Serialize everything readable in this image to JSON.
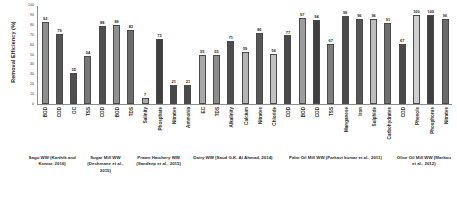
{
  "chart_data": {
    "type": "bar",
    "title": "",
    "xlabel": "",
    "ylabel": "Removal Efficiency (%)",
    "ylim": [
      0,
      100
    ],
    "y_ticks": [
      0,
      10,
      20,
      30,
      40,
      50,
      60,
      70,
      80,
      90,
      100
    ],
    "grid": false,
    "legend": "none",
    "categories": [
      "BOD",
      "COD",
      "OC",
      "TSS",
      "COD",
      "BOD",
      "TDS",
      "Salinity",
      "Phosphate",
      "Nitrates",
      "Ammonia",
      "EC",
      "TDS",
      "Alkalinity",
      "Calcium",
      "Nitrates",
      "Chloride",
      "COD",
      "BOD",
      "COD",
      "TSS",
      "Manganese",
      "Iron",
      "Sulphide",
      "Carbohydrates",
      "COD",
      "Phenols",
      "Phosphorus",
      "Nitrates"
    ],
    "values": [
      92,
      79,
      35,
      54,
      88,
      89,
      83,
      7,
      73,
      21,
      21,
      55,
      55,
      71,
      59,
      80,
      56,
      77,
      97,
      94,
      67,
      99,
      96,
      96,
      91,
      67,
      100,
      100,
      96
    ],
    "bar_colors": [
      "#8f8f8f",
      "#555555",
      "#4f4f4f",
      "#777777",
      "#4d4d4d",
      "#909090",
      "#6b6b6b",
      "#aaaaaa",
      "#3f3f3f",
      "#4a4a4a",
      "#4a4a4a",
      "#a8a8a8",
      "#8b8b8b",
      "#4d4d4d",
      "#b4b4b4",
      "#575757",
      "#c2c2c2",
      "#4a4a4a",
      "#9d9d9d",
      "#3f3f3f",
      "#7d7d7d",
      "#4a4a4a",
      "#565656",
      "#bdbdbd",
      "#6e6e6e",
      "#4a4a4a",
      "#cfcfcf",
      "#3f3f3f",
      "#6a6a6a"
    ],
    "groups": [
      {
        "label": "Sago WW (Karthik and Kumar, 2016)",
        "count": 4
      },
      {
        "label": "Sugar Mill WW (Deshmane et al., 2015)",
        "count": 3
      },
      {
        "label": "Prawn Hatchery WW (Sandeep et al., 2015)",
        "count": 4
      },
      {
        "label": "Dairy WW (Saud G.K. Al Ahmad, 2014)",
        "count": 6
      },
      {
        "label": "Palm Oil Mill WW (Parkavi kumar et al., 2011)",
        "count": 8
      },
      {
        "label": "Olive Oil Mill WW (Markou et al., 2012)",
        "count": 4
      }
    ]
  }
}
